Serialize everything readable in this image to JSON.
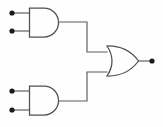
{
  "diagram": {
    "type": "logic-gate-schematic",
    "background_color": "#fefefe",
    "wire_color": "#5a5a5a",
    "gate_outline_color": "#4f4f4f",
    "terminal_color": "#1a1a1a",
    "canvas": {
      "width": 163,
      "height": 127
    },
    "gates": [
      {
        "id": "and-gate-top",
        "kind": "AND",
        "label": "",
        "body": {
          "x": 29,
          "y": 8,
          "width": 30,
          "height": 29
        },
        "inputs": [
          {
            "id": "input-a",
            "terminal": {
              "x": 12,
              "y": 13
            },
            "lead_end_x": 29
          },
          {
            "id": "input-b",
            "terminal": {
              "x": 12,
              "y": 31
            },
            "lead_end_x": 29
          }
        ],
        "output": {
          "id": "and-top-out",
          "x": 59,
          "y": 22
        }
      },
      {
        "id": "and-gate-bottom",
        "kind": "AND",
        "label": "",
        "body": {
          "x": 29,
          "y": 86,
          "width": 30,
          "height": 29
        },
        "inputs": [
          {
            "id": "input-c",
            "terminal": {
              "x": 12,
              "y": 91
            },
            "lead_end_x": 29
          },
          {
            "id": "input-d",
            "terminal": {
              "x": 12,
              "y": 110
            },
            "lead_end_x": 29
          }
        ],
        "output": {
          "id": "and-bottom-out",
          "x": 59,
          "y": 101
        }
      },
      {
        "id": "or-gate",
        "kind": "OR",
        "label": "",
        "body": {
          "x": 107,
          "y": 46,
          "width": 31,
          "height": 30
        },
        "inputs": [
          {
            "id": "or-in-1",
            "x": 107,
            "y": 52
          },
          {
            "id": "or-in-2",
            "x": 107,
            "y": 72
          }
        ],
        "output": {
          "id": "circuit-out",
          "x": 138,
          "y": 61,
          "terminal": {
            "x": 152,
            "y": 61
          }
        }
      }
    ],
    "wires": [
      {
        "id": "wire-and-top-to-or",
        "points": "59,22 87,22 87,52 107,52"
      },
      {
        "id": "wire-and-bottom-to-or",
        "points": "59,101 87,101 87,72 107,72"
      },
      {
        "id": "wire-or-to-output",
        "points": "138,61 151,61"
      }
    ],
    "terminals": [
      {
        "id": "terminal-input-a",
        "x": 12,
        "y": 13,
        "r": 2.6
      },
      {
        "id": "terminal-input-b",
        "x": 12,
        "y": 31,
        "r": 2.6
      },
      {
        "id": "terminal-input-c",
        "x": 12,
        "y": 91,
        "r": 2.6
      },
      {
        "id": "terminal-input-d",
        "x": 12,
        "y": 110,
        "r": 2.6
      },
      {
        "id": "terminal-output",
        "x": 152,
        "y": 61,
        "r": 2.6
      }
    ]
  }
}
